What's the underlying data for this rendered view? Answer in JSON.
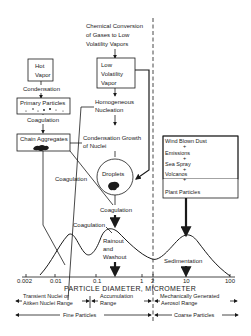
{
  "diagram": {
    "nodes": {
      "chemical_conversion": [
        "Chemical Conversion",
        "of Gases to Low",
        "Volatility Vapors"
      ],
      "hot_vapor": [
        "Hot",
        "Vapor"
      ],
      "condensation": "Condensation",
      "primary_particles": "Primary Particles",
      "coagulation_1": "Coagulation",
      "chain_aggregates": "Chain Aggregates",
      "low_volatility_vapor": [
        "Low",
        "Volatility",
        "Vapor"
      ],
      "homogeneous_nucleation": [
        "Homogeneous",
        "Nucleation"
      ],
      "condensation_growth": [
        "Condensation Growth",
        "of Nuclei"
      ],
      "droplets": "Droplets",
      "coagulation_left": "Coagulation",
      "coagulation_center": "Coagulation",
      "coagulation_peak": "Coagulation",
      "rainout": [
        "Rainout",
        "and",
        "Washout"
      ],
      "sedimentation": "Sedimentation",
      "coarse_sources": [
        "Wind Blown Dust",
        "+",
        "Emissions",
        "+",
        "Sea Spray",
        "+",
        "Volcanos",
        "+",
        "Plant Particles"
      ]
    },
    "axis": {
      "label": "PARTICLE DIAMETER, MICROMETER",
      "ticks": [
        "0.002",
        "0.01",
        "0.1",
        "1",
        "2",
        "10",
        "100"
      ]
    },
    "ranges": {
      "transient": [
        "Transient Nuclei or",
        "Aitken Nuclei Range"
      ],
      "accumulation": [
        "Accumulation",
        "Range"
      ],
      "mechanical": [
        "Mechanically Generated",
        "Aerosol Range"
      ],
      "fine": "Fine Particles",
      "coarse": "Coarse Particles"
    }
  }
}
